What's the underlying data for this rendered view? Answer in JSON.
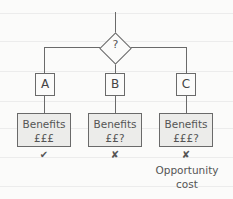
{
  "diagram": {
    "decision": {
      "label": "?"
    },
    "options": [
      {
        "label": "A",
        "benefit_title": "Benefits",
        "benefit_value": "£££",
        "mark": "✔",
        "mark_name": "check-icon"
      },
      {
        "label": "B",
        "benefit_title": "Benefits",
        "benefit_value": "££?",
        "mark": "✘",
        "mark_name": "cross-icon"
      },
      {
        "label": "C",
        "benefit_title": "Benefits",
        "benefit_value": "£££?",
        "mark": "✘",
        "mark_name": "cross-icon"
      }
    ],
    "note": "Opportunity cost"
  }
}
